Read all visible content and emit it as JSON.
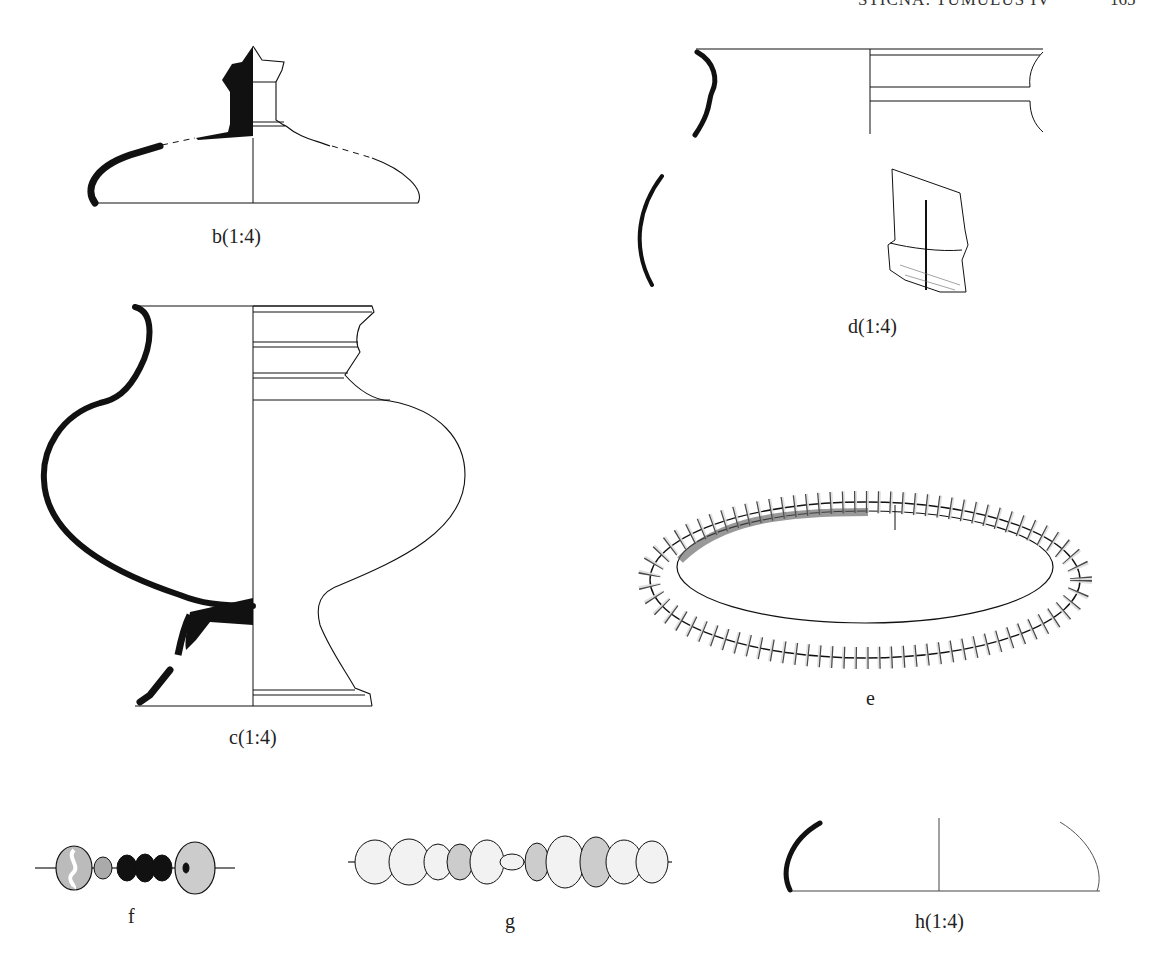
{
  "running_header": {
    "title": "STIČNA: TUMULUS IV",
    "page_number": "165"
  },
  "figures": [
    {
      "id": "b",
      "label": "b(1:4)",
      "object": "lid with knob (section + profile)"
    },
    {
      "id": "c",
      "label": "c(1:4)",
      "object": "pedestalled vessel (section + profile)"
    },
    {
      "id": "d",
      "label": "d(1:4)",
      "object": "vessel rim and body fragments"
    },
    {
      "id": "e",
      "label": "e",
      "object": "ribbed ring / bracelet"
    },
    {
      "id": "f",
      "label": "f",
      "object": "bead string (glass and amber beads)"
    },
    {
      "id": "g",
      "label": "g",
      "object": "bead string (11 beads)"
    },
    {
      "id": "h",
      "label": "h(1:4)",
      "object": "bowl fragment (section + profile)"
    }
  ]
}
